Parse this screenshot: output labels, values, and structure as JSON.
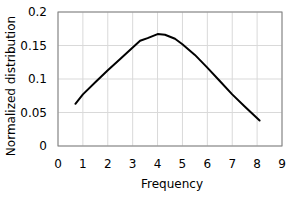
{
  "chart_data": {
    "type": "line",
    "title": "",
    "xlabel": "Frequency",
    "ylabel": "Normalized distribution",
    "xlim": [
      0,
      9
    ],
    "ylim": [
      0,
      0.2
    ],
    "xticks": [
      0,
      1,
      2,
      3,
      4,
      5,
      6,
      7,
      8,
      9
    ],
    "xtick_labels": [
      "0",
      "1",
      "2",
      "3",
      "4",
      "5",
      "6",
      "7",
      "8",
      "9"
    ],
    "yticks": [
      0,
      0.05,
      0.1,
      0.15,
      0.2
    ],
    "ytick_labels": [
      "0",
      "0.05",
      "0.1",
      "0.15",
      "0.2"
    ],
    "grid": true,
    "legend": null,
    "series": [
      {
        "name": "Normalized distribution",
        "color": "#000000",
        "x": [
          0.7,
          1.0,
          1.5,
          2.0,
          2.5,
          3.0,
          3.3,
          3.6,
          4.0,
          4.3,
          4.7,
          5.0,
          5.5,
          6.0,
          6.5,
          7.0,
          7.5,
          8.1
        ],
        "y": [
          0.063,
          0.077,
          0.095,
          0.113,
          0.13,
          0.147,
          0.157,
          0.161,
          0.167,
          0.166,
          0.16,
          0.152,
          0.136,
          0.117,
          0.097,
          0.077,
          0.059,
          0.038
        ]
      }
    ]
  },
  "colors": {
    "line": "#000000",
    "grid": "#d9d9d9",
    "frame": "#7f7f7f",
    "background": "#ffffff"
  }
}
